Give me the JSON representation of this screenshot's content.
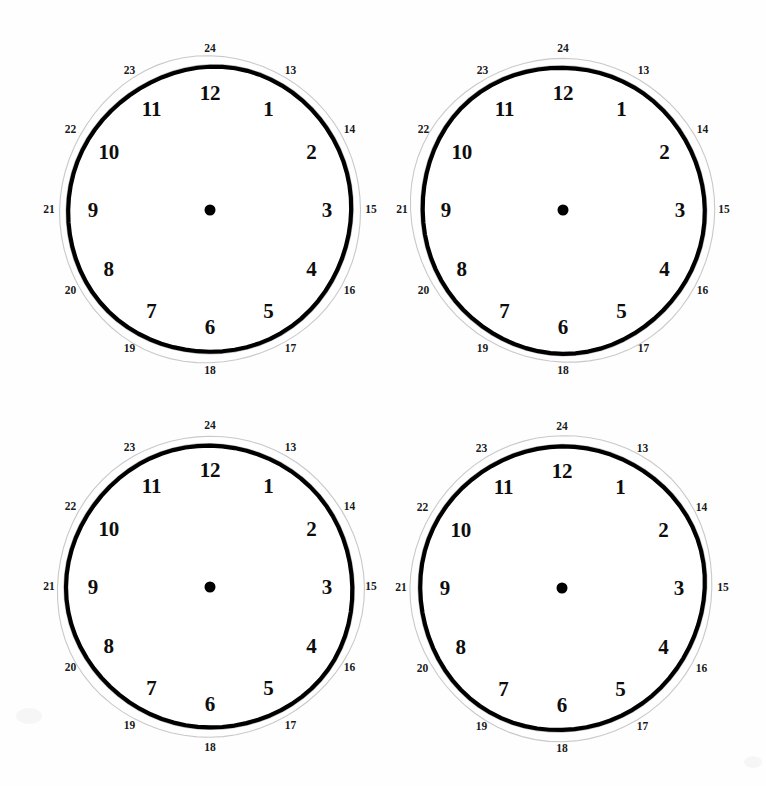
{
  "page": {
    "background_color": "#ffffff",
    "width": 766,
    "height": 786
  },
  "style": {
    "ring_color": "#000000",
    "outer_ring_color": "#c9c9c9",
    "numeral_color": "#0d0d0d",
    "outer_numeral_color": "#1a1a1a",
    "center_dot_color": "#000000",
    "ring_radius": 142,
    "outer_ring_radius": 152,
    "hour_numeral_radius": 117,
    "outer_numeral_radius": 161,
    "center_dot_diameter": 11
  },
  "clock_face": {
    "hour_numerals": [
      "1",
      "2",
      "3",
      "4",
      "5",
      "6",
      "7",
      "8",
      "9",
      "10",
      "11",
      "12"
    ],
    "outer_numerals": [
      "13",
      "14",
      "15",
      "16",
      "17",
      "18",
      "19",
      "20",
      "21",
      "22",
      "23",
      "24"
    ],
    "hands": [],
    "center_dot": true
  },
  "clocks": [
    {
      "id": "clock-top-left",
      "label": "Clock 1",
      "center_x": 210,
      "center_y": 210,
      "time_shown": "",
      "hands": []
    },
    {
      "id": "clock-top-right",
      "label": "Clock 2",
      "center_x": 563,
      "center_y": 210,
      "time_shown": "",
      "hands": []
    },
    {
      "id": "clock-bottom-left",
      "label": "Clock 3",
      "center_x": 210,
      "center_y": 587,
      "time_shown": "",
      "hands": []
    },
    {
      "id": "clock-bottom-right",
      "label": "Clock 4",
      "center_x": 562,
      "center_y": 588,
      "time_shown": "",
      "hands": []
    }
  ]
}
